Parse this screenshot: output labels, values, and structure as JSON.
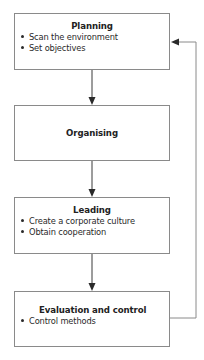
{
  "diagram": {
    "type": "flowchart",
    "direction": "top-to-bottom",
    "colors": {
      "box_border": "#8a8a8a",
      "arrow": "#3a3a3a",
      "text": "#2a2a2a",
      "background": "#ffffff"
    },
    "boxes": [
      {
        "title": "Planning",
        "bullets": [
          "Scan the environment",
          "Set objectives"
        ]
      },
      {
        "title": "Organising",
        "bullets": []
      },
      {
        "title": "Leading",
        "bullets": [
          "Create a corporate culture",
          "Obtain cooperation"
        ]
      },
      {
        "title": "Evaluation and control",
        "bullets": [
          "Control methods"
        ]
      }
    ],
    "edges": [
      {
        "from": "Planning",
        "to": "Organising"
      },
      {
        "from": "Organising",
        "to": "Leading"
      },
      {
        "from": "Leading",
        "to": "Evaluation and control"
      },
      {
        "from": "Evaluation and control",
        "to": "Planning",
        "kind": "feedback-loop"
      }
    ]
  }
}
